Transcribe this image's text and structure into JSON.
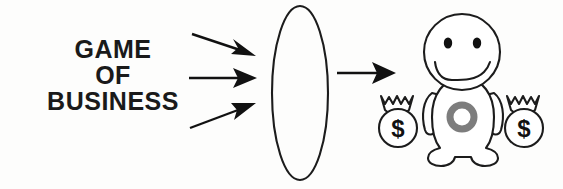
{
  "canvas": {
    "width": 563,
    "height": 189,
    "background_color": "#fdfdfc",
    "ink_color": "#1c1c1c",
    "accent_gray": "#7d7d7d"
  },
  "label": {
    "name": "game-of-business-label",
    "lines": [
      "GAME",
      "OF",
      "BUSINESS"
    ],
    "color": "#1a1a1a"
  },
  "input_arrows": {
    "name": "input-arrows",
    "count": 3,
    "items": [
      {
        "direction": "down-right",
        "label": ""
      },
      {
        "direction": "right",
        "label": ""
      },
      {
        "direction": "up-right",
        "label": ""
      }
    ]
  },
  "process": {
    "name": "process-ellipse",
    "shape": "ellipse",
    "label": ""
  },
  "output_arrow": {
    "name": "output-arrow",
    "direction": "right",
    "label": ""
  },
  "character": {
    "name": "happy-person-figure",
    "expression": "smiling",
    "eyes": 2,
    "belly_emblem": "ring",
    "belly_emblem_color": "#7d7d7d"
  },
  "money_bags": {
    "name": "money-bags",
    "count": 2,
    "symbol": "$",
    "items": [
      {
        "side": "left",
        "symbol": "$"
      },
      {
        "side": "right",
        "symbol": "$"
      }
    ]
  }
}
